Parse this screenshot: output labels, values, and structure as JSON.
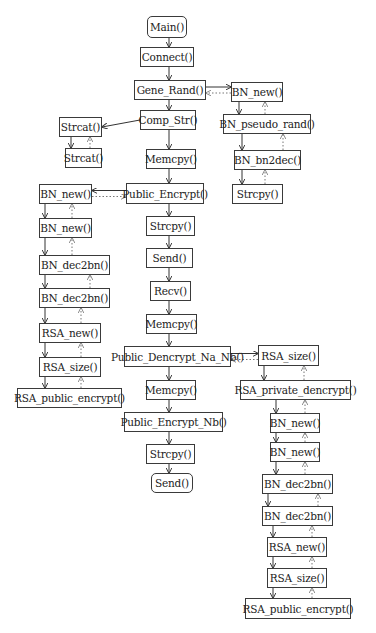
{
  "diagram": {
    "type": "call-flow",
    "nodes": [
      {
        "id": "main",
        "label": "Main()",
        "x": 147,
        "y": 16,
        "w": 40,
        "h": 22,
        "rounded": true
      },
      {
        "id": "connect",
        "label": "Connect()",
        "x": 140,
        "y": 47,
        "w": 54,
        "h": 20
      },
      {
        "id": "gene_rand",
        "label": "Gene_Rand()",
        "x": 134,
        "y": 80,
        "w": 72,
        "h": 20
      },
      {
        "id": "bn_new_r1",
        "label": "BN_new()",
        "x": 231,
        "y": 82,
        "w": 52,
        "h": 20
      },
      {
        "id": "comp_str",
        "label": "Comp_Str()",
        "x": 140,
        "y": 110,
        "w": 56,
        "h": 20
      },
      {
        "id": "bn_pseudo_rand",
        "label": "BN_pseudo_rand()",
        "x": 223,
        "y": 114,
        "w": 88,
        "h": 20
      },
      {
        "id": "strcat_1",
        "label": "Strcat()",
        "x": 59,
        "y": 117,
        "w": 43,
        "h": 20
      },
      {
        "id": "strcat_2",
        "label": "Strcat()",
        "x": 65,
        "y": 148,
        "w": 37,
        "h": 20
      },
      {
        "id": "memcpy_1",
        "label": "Memcpy()",
        "x": 146,
        "y": 149,
        "w": 50,
        "h": 20
      },
      {
        "id": "bn_bn2dec",
        "label": "BN_bn2dec()",
        "x": 234,
        "y": 150,
        "w": 67,
        "h": 20
      },
      {
        "id": "strcpy_r",
        "label": "Strcpy()",
        "x": 232,
        "y": 184,
        "w": 51,
        "h": 20
      },
      {
        "id": "bn_new_l1",
        "label": "BN_new()",
        "x": 39,
        "y": 184,
        "w": 53,
        "h": 20
      },
      {
        "id": "public_encrypt",
        "label": "Public_Encrypt()",
        "x": 126,
        "y": 183,
        "w": 78,
        "h": 21
      },
      {
        "id": "bn_new_l2",
        "label": "BN_new()",
        "x": 39,
        "y": 218,
        "w": 53,
        "h": 20
      },
      {
        "id": "strcpy_1",
        "label": "Strcpy()",
        "x": 146,
        "y": 216,
        "w": 49,
        "h": 20
      },
      {
        "id": "bn_dec2bn_l1",
        "label": "BN_dec2bn()",
        "x": 39,
        "y": 255,
        "w": 71,
        "h": 20
      },
      {
        "id": "send_1",
        "label": "Send()",
        "x": 146,
        "y": 248,
        "w": 47,
        "h": 20
      },
      {
        "id": "bn_dec2bn_l2",
        "label": "BN_dec2bn()",
        "x": 39,
        "y": 288,
        "w": 71,
        "h": 20
      },
      {
        "id": "recv",
        "label": "Recv()",
        "x": 150,
        "y": 281,
        "w": 41,
        "h": 20
      },
      {
        "id": "memcpy_2",
        "label": "Memcpy()",
        "x": 146,
        "y": 314,
        "w": 51,
        "h": 20
      },
      {
        "id": "rsa_new_l",
        "label": "RSA_new()",
        "x": 39,
        "y": 323,
        "w": 62,
        "h": 20
      },
      {
        "id": "public_dencrypt_na_nb",
        "label": "Public_Dencrypt_Na_Nb()",
        "x": 124,
        "y": 346,
        "w": 107,
        "h": 21
      },
      {
        "id": "rsa_size_r1",
        "label": "RSA_size()",
        "x": 258,
        "y": 345,
        "w": 61,
        "h": 21
      },
      {
        "id": "rsa_size_l",
        "label": "RSA_size()",
        "x": 39,
        "y": 357,
        "w": 62,
        "h": 20
      },
      {
        "id": "rsa_public_encrypt_l",
        "label": "RSA_public_encrypt()",
        "x": 17,
        "y": 388,
        "w": 105,
        "h": 20
      },
      {
        "id": "memcpy_3",
        "label": "Memcpy()",
        "x": 146,
        "y": 380,
        "w": 50,
        "h": 20
      },
      {
        "id": "rsa_private_dencrypt",
        "label": "RSA_private_dencrypt()",
        "x": 240,
        "y": 380,
        "w": 111,
        "h": 20
      },
      {
        "id": "public_encrypt_nb",
        "label": "Public_Encrypt_Nb()",
        "x": 124,
        "y": 412,
        "w": 99,
        "h": 20
      },
      {
        "id": "bn_new_r2",
        "label": "BN_new()",
        "x": 270,
        "y": 413,
        "w": 50,
        "h": 20
      },
      {
        "id": "strcpy_2",
        "label": "Strcpy()",
        "x": 146,
        "y": 444,
        "w": 49,
        "h": 20
      },
      {
        "id": "bn_new_r3",
        "label": "BN_new()",
        "x": 270,
        "y": 442,
        "w": 50,
        "h": 20
      },
      {
        "id": "send_2",
        "label": "Send()",
        "x": 151,
        "y": 473,
        "w": 42,
        "h": 20,
        "rounded": true
      },
      {
        "id": "bn_dec2bn_r1",
        "label": "BN_dec2bn()",
        "x": 262,
        "y": 474,
        "w": 71,
        "h": 20
      },
      {
        "id": "bn_dec2bn_r2",
        "label": "BN_dec2bn()",
        "x": 262,
        "y": 506,
        "w": 71,
        "h": 20
      },
      {
        "id": "rsa_new_r",
        "label": "RSA_new()",
        "x": 267,
        "y": 537,
        "w": 60,
        "h": 20
      },
      {
        "id": "rsa_size_r2",
        "label": "RSA_size()",
        "x": 267,
        "y": 568,
        "w": 60,
        "h": 20
      },
      {
        "id": "rsa_public_encrypt_r",
        "label": "RSA_public_encrypt()",
        "x": 245,
        "y": 598,
        "w": 106,
        "h": 21
      }
    ],
    "edges": [
      {
        "from": "main",
        "to": "connect",
        "style": "solid"
      },
      {
        "from": "connect",
        "to": "gene_rand",
        "style": "solid"
      },
      {
        "from": "gene_rand",
        "to": "comp_str",
        "style": "solid"
      },
      {
        "from": "comp_str",
        "to": "memcpy_1",
        "style": "solid"
      },
      {
        "from": "memcpy_1",
        "to": "public_encrypt",
        "style": "solid"
      },
      {
        "from": "public_encrypt",
        "to": "strcpy_1",
        "style": "solid"
      },
      {
        "from": "strcpy_1",
        "to": "send_1",
        "style": "solid"
      },
      {
        "from": "send_1",
        "to": "recv",
        "style": "solid"
      },
      {
        "from": "recv",
        "to": "memcpy_2",
        "style": "solid"
      },
      {
        "from": "memcpy_2",
        "to": "public_dencrypt_na_nb",
        "style": "solid"
      },
      {
        "from": "public_dencrypt_na_nb",
        "to": "memcpy_3",
        "style": "solid"
      },
      {
        "from": "memcpy_3",
        "to": "public_encrypt_nb",
        "style": "solid"
      },
      {
        "from": "public_encrypt_nb",
        "to": "strcpy_2",
        "style": "solid"
      },
      {
        "from": "strcpy_2",
        "to": "send_2",
        "style": "solid"
      },
      {
        "from": "gene_rand",
        "to": "bn_new_r1",
        "style": "solid"
      },
      {
        "from": "bn_new_r1",
        "to": "gene_rand",
        "style": "dotted"
      },
      {
        "from": "comp_str",
        "to": "strcat_1",
        "style": "solid"
      },
      {
        "from": "public_encrypt",
        "to": "bn_new_l1",
        "style": "solid"
      },
      {
        "from": "bn_new_l1",
        "to": "public_encrypt",
        "style": "dotted"
      },
      {
        "from": "public_dencrypt_na_nb",
        "to": "rsa_size_r1",
        "style": "solid"
      },
      {
        "from": "rsa_size_r1",
        "to": "public_dencrypt_na_nb",
        "style": "dotted"
      }
    ]
  }
}
